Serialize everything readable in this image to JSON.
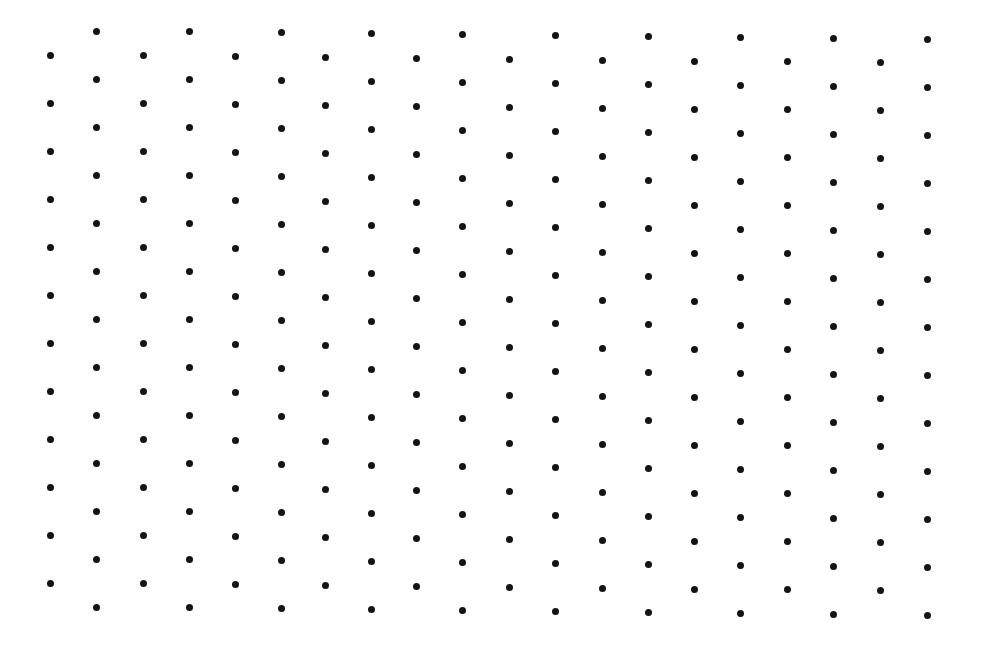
{
  "canvas": {
    "width": 981,
    "height": 649,
    "background": "#ffffff"
  },
  "pattern": {
    "type": "staggered-dot-grid",
    "dot_color": "#141414",
    "dot_diameter": 7,
    "row_spacing": 48,
    "drift_per_column": 0.45,
    "columns": [
      {
        "x": 50,
        "y_start": 55,
        "count": 12
      },
      {
        "x": 96,
        "y_start": 31,
        "count": 13
      },
      {
        "x": 143,
        "y_start": 55,
        "count": 12
      },
      {
        "x": 189,
        "y_start": 31,
        "count": 13
      },
      {
        "x": 235,
        "y_start": 56,
        "count": 12
      },
      {
        "x": 281,
        "y_start": 32,
        "count": 13
      },
      {
        "x": 325,
        "y_start": 57,
        "count": 12
      },
      {
        "x": 371,
        "y_start": 33,
        "count": 13
      },
      {
        "x": 416,
        "y_start": 58,
        "count": 12
      },
      {
        "x": 462,
        "y_start": 34,
        "count": 13
      },
      {
        "x": 509,
        "y_start": 59,
        "count": 12
      },
      {
        "x": 555,
        "y_start": 35,
        "count": 13
      },
      {
        "x": 602,
        "y_start": 60,
        "count": 12
      },
      {
        "x": 648,
        "y_start": 36,
        "count": 13
      },
      {
        "x": 694,
        "y_start": 61,
        "count": 12
      },
      {
        "x": 740,
        "y_start": 37,
        "count": 13
      },
      {
        "x": 787,
        "y_start": 61,
        "count": 12
      },
      {
        "x": 833,
        "y_start": 38,
        "count": 13
      },
      {
        "x": 880,
        "y_start": 62,
        "count": 12
      },
      {
        "x": 927,
        "y_start": 39,
        "count": 13
      }
    ]
  }
}
